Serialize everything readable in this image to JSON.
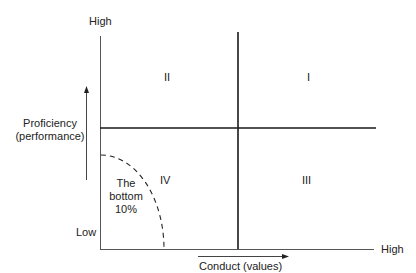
{
  "diagram": {
    "y_axis": {
      "label_line1": "Proficiency",
      "label_line2": "(performance)",
      "high": "High",
      "low": "Low"
    },
    "x_axis": {
      "label": "Conduct (values)",
      "high": "High"
    },
    "quadrants": {
      "q1": "I",
      "q2": "II",
      "q3": "III",
      "q4": "IV"
    },
    "bottom_region": {
      "line1": "The",
      "line2": "bottom",
      "line3": "10%"
    },
    "colors": {
      "line": "#1a1a1a",
      "axis": "#555555"
    }
  }
}
